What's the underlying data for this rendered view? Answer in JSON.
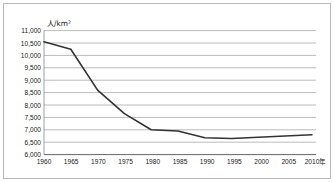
{
  "chart_data": {
    "type": "line",
    "title": "",
    "subtitle": "",
    "xlabel": "年",
    "ylabel": "人/km²",
    "unit_label": "人/km²",
    "x_axis_unit_suffix": "年",
    "grid": true,
    "legend": false,
    "legend_position": "none",
    "categories": [
      1960,
      1965,
      1970,
      1975,
      1980,
      1985,
      1990,
      1995,
      2000,
      2005,
      2010
    ],
    "x": [
      1960,
      1965,
      1970,
      1975,
      1980,
      1985,
      1990,
      1995,
      2000,
      2005,
      2010
    ],
    "values": [
      10550,
      10250,
      8600,
      7650,
      7000,
      6950,
      6680,
      6650,
      6700,
      6750,
      6800
    ],
    "series": [
      {
        "name": "人口密度",
        "values": [
          10550,
          10250,
          8600,
          7650,
          7000,
          6950,
          6680,
          6650,
          6700,
          6750,
          6800
        ],
        "color": "#333333"
      }
    ],
    "xlim": [
      1960,
      2010
    ],
    "ylim": [
      6000,
      11000
    ],
    "y_ticks": [
      6000,
      6500,
      7000,
      7500,
      8000,
      8500,
      9000,
      9500,
      10000,
      10500,
      11000
    ],
    "y_tick_labels": [
      "6,000",
      "6,500",
      "7,000",
      "7,500",
      "8,000",
      "8,500",
      "9,000",
      "9,500",
      "10,000",
      "10,500",
      "11,000"
    ],
    "x_ticks": [
      1960,
      1965,
      1970,
      1975,
      1980,
      1985,
      1990,
      1995,
      2000,
      2005,
      2010
    ],
    "x_tick_labels": [
      "1960",
      "1965",
      "1970",
      "1975",
      "1980",
      "1985",
      "1990",
      "1995",
      "2000",
      "2005",
      "2010"
    ],
    "colors": {
      "line": "#333333",
      "grid": "#aaaaaa",
      "axis": "#555555",
      "frame": "#b8b8b8",
      "text": "#1a1a1a",
      "background": "#ffffff"
    }
  }
}
